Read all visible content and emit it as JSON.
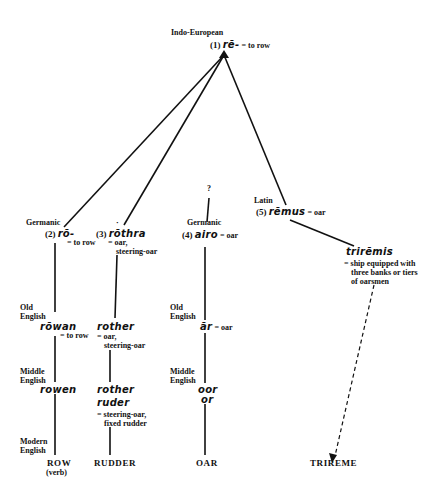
{
  "root": {
    "family": "Indo-European",
    "number": "(1)",
    "form": "rē-",
    "gloss": "= to row"
  },
  "branches": {
    "row": {
      "family": "Germanic",
      "number": "(2)",
      "form": "rō-",
      "gloss": "= to row",
      "old_english_label_1": "Old",
      "old_english_label_2": "English",
      "old_english_form": "rōwan",
      "old_english_gloss": "= to row",
      "middle_english_label_1": "Middle",
      "middle_english_label_2": "English",
      "middle_english_form": "rowen",
      "modern_english_label_1": "Modern",
      "modern_english_label_2": "English",
      "modern_word": "ROW",
      "modern_note": "(verb)"
    },
    "rudder": {
      "asterisk": "·",
      "number": "(3)",
      "form": "rōthra",
      "gloss_1": "= oar,",
      "gloss_2": "steering-oar",
      "old_english_form": "rother",
      "old_english_gloss_1": "= oar,",
      "old_english_gloss_2": "steering-oar",
      "middle_english_form_1": "rother",
      "middle_english_form_2": "ruder",
      "middle_english_gloss_1": "= steering-oar,",
      "middle_english_gloss_2": "fixed rudder",
      "modern_word": "RUDDER"
    },
    "oar": {
      "origin": "?",
      "family": "Germanic",
      "number": "(4)",
      "form": "airo",
      "gloss": "= oar",
      "old_english_label_1": "Old",
      "old_english_label_2": "English",
      "old_english_form": "ār",
      "old_english_gloss": "= oar",
      "middle_english_label_1": "Middle",
      "middle_english_label_2": "English",
      "middle_english_form_1": "oor",
      "middle_english_form_2": "or",
      "modern_word": "OAR"
    },
    "trireme": {
      "family": "Latin",
      "number": "(5)",
      "form": "rēmus",
      "gloss": "= oar",
      "derived_form": "trirēmis",
      "derived_gloss_1": "= ship equipped with",
      "derived_gloss_2": "three banks or tiers",
      "derived_gloss_3": "of oarsmen",
      "modern_word": "TRIREME"
    }
  },
  "colors": {
    "line": "#111111",
    "text": "#111111",
    "background": "#ffffff"
  }
}
